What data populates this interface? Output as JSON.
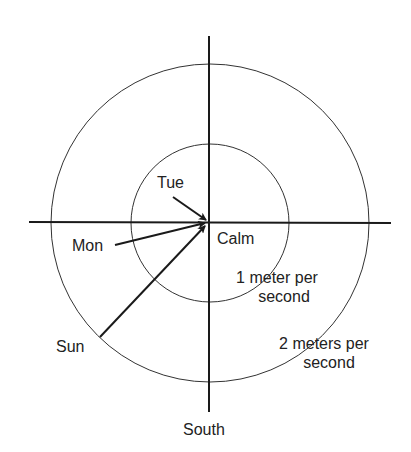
{
  "diagram": {
    "title_axis_label": "South",
    "rings": [
      {
        "name": "calm",
        "label": "Calm"
      },
      {
        "name": "inner",
        "label_line1": "1 meter per",
        "label_line2": "second"
      },
      {
        "name": "outer",
        "label_line1": "2 meters per",
        "label_line2": "second"
      }
    ],
    "arrows": [
      {
        "day": "Tue"
      },
      {
        "day": "Mon"
      },
      {
        "day": "Sun"
      }
    ],
    "colors": {
      "line": "#1a1a1a",
      "background": "#ffffff"
    }
  }
}
